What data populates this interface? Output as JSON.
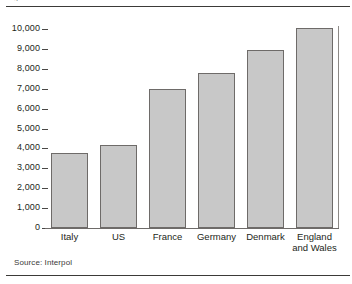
{
  "figure": {
    "top_sliver_text": "g",
    "source_note": "Source: Interpol"
  },
  "chart_data": {
    "type": "bar",
    "title": "",
    "xlabel": "",
    "ylabel": "",
    "categories": [
      "Italy",
      "US",
      "France",
      "Germany",
      "Denmark",
      "England and Wales"
    ],
    "values": [
      3780,
      4180,
      7000,
      7800,
      8950,
      10050
    ],
    "ylim": [
      0,
      10000
    ],
    "ytick_values": [
      0,
      1000,
      2000,
      3000,
      4000,
      5000,
      6000,
      7000,
      8000,
      9000,
      10000
    ],
    "ytick_labels": [
      "0",
      "1,000",
      "2,000",
      "3,000",
      "4,000",
      "5,000",
      "6,000",
      "7,000",
      "8,000",
      "9,000",
      "10,000"
    ],
    "grid": false,
    "legend": null,
    "bar_color": "#c8c8c8",
    "bar_border_color": "#6e6b69",
    "annotations": [
      "Source: Interpol"
    ]
  }
}
